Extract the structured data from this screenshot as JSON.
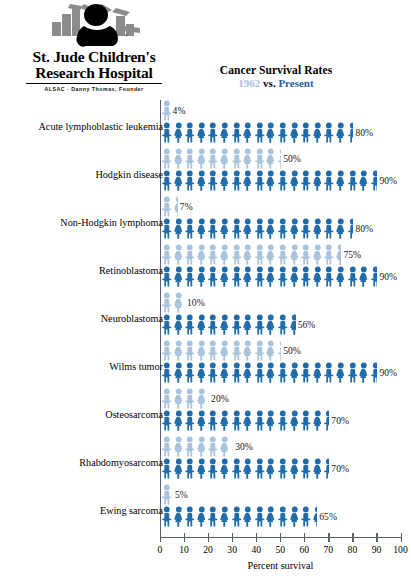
{
  "logo": {
    "mark_icon": "st-jude-child-logo-icon",
    "name_line1": "St. Jude Children's",
    "name_line2": "Research Hospital",
    "tagline": "ALSAC · Danny Thomas, Founder"
  },
  "title": {
    "main": "Cancer Survival Rates",
    "year_old": "1962",
    "vs": "vs.",
    "year_new": "Present"
  },
  "axis": {
    "title": "Percent survival",
    "ticks": [
      "0",
      "10",
      "20",
      "30",
      "40",
      "50",
      "60",
      "70",
      "80",
      "90",
      "100"
    ],
    "min": 0,
    "max": 100
  },
  "colors": {
    "old_series": "#a9c3dc",
    "new_series": "#1f6cab",
    "axis": "#55626e",
    "text": "#111111"
  },
  "legend": {
    "old_label": "1962",
    "new_label": "Present"
  },
  "chart_data": {
    "type": "bar",
    "title": "Cancer Survival Rates",
    "subtitle": "1962 vs. Present",
    "xlabel": "Percent survival",
    "ylabel": "",
    "xlim": [
      0,
      100
    ],
    "grid": false,
    "legend_position": "title",
    "unit_per_icon": 5,
    "value_suffix": "%",
    "categories": [
      "Acute lymphoblastic leukemia",
      "Hodgkin disease",
      "Non-Hodgkin lymphoma",
      "Retinoblastoma",
      "Neuroblastoma",
      "Wilms tumor",
      "Osteosarcoma",
      "Rhabdomyosarcoma",
      "Ewing sarcoma"
    ],
    "series": [
      {
        "name": "1962",
        "values": [
          4,
          50,
          7,
          75,
          10,
          50,
          20,
          30,
          5
        ]
      },
      {
        "name": "Present",
        "values": [
          80,
          90,
          80,
          90,
          56,
          90,
          70,
          70,
          65
        ]
      }
    ],
    "labels": {
      "1962": [
        "4%",
        "50%",
        "7%",
        "75%",
        "10%",
        "50%",
        "20%",
        "30%",
        "5%"
      ],
      "Present": [
        "80%",
        "90%",
        "80%",
        "90%",
        "56%",
        "90%",
        "70%",
        "70%",
        "65%"
      ]
    }
  }
}
